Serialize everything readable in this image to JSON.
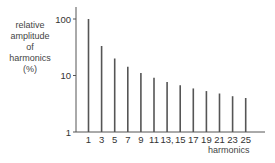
{
  "chart_data": {
    "type": "bar",
    "title": "",
    "xlabel": "harmonics",
    "ylabel_lines": [
      "relative",
      "amplitude",
      "of",
      "harmonics",
      "(%)"
    ],
    "ylabel": "relative amplitude of harmonics (%)",
    "yscale": "log",
    "ylim": [
      1,
      100
    ],
    "yticks": [
      "100",
      "10",
      "1"
    ],
    "categories": [
      "1",
      "3",
      "5",
      "7",
      "9",
      "11",
      "13",
      "15",
      "17",
      "19",
      "21",
      "23",
      "25"
    ],
    "xtick_labels": [
      "1",
      "3",
      "5",
      "7",
      "9",
      "11",
      "13,",
      "15",
      "17",
      "19",
      "21",
      "23",
      "25"
    ],
    "values": [
      100,
      33.3,
      20,
      14.3,
      11.1,
      9.1,
      7.7,
      6.7,
      5.9,
      5.3,
      4.8,
      4.3,
      4.0
    ],
    "grid": false,
    "legend": null
  },
  "colors": {
    "bar": "#555555",
    "axis": "#555555",
    "text": "#333333"
  }
}
